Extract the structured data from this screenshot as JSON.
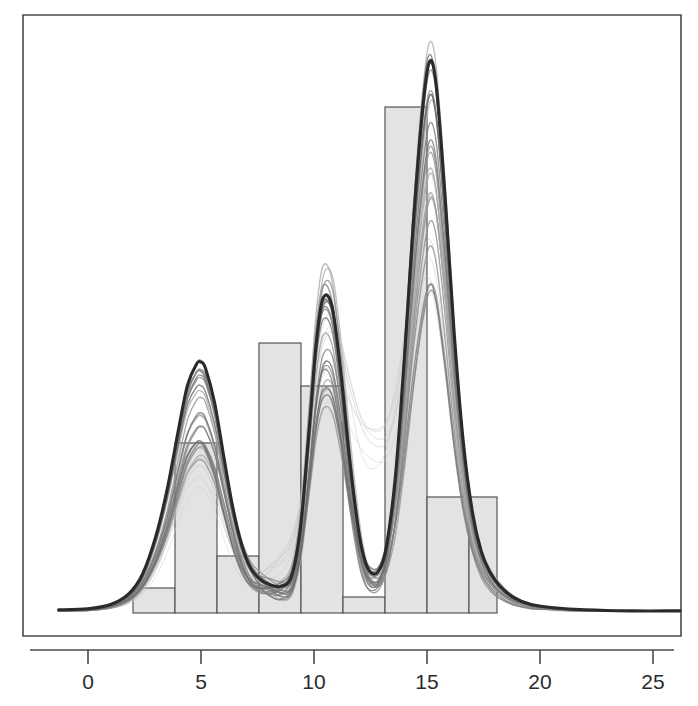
{
  "figure": {
    "name": "bootstrapped-kernel-density-over-histogram",
    "width": 698,
    "height": 706,
    "background_color": "#ffffff",
    "frame_color": "#4a4a4a"
  },
  "axis": {
    "x_tick_labels": [
      "0",
      "5",
      "10",
      "15",
      "20",
      "25"
    ],
    "x_tick_values": [
      0,
      5,
      10,
      15,
      20,
      25
    ],
    "x_tick_pixels": [
      88,
      201,
      314,
      427,
      540,
      653
    ],
    "label_color": "#2b2b2b",
    "label_font_size": 21
  },
  "colors": {
    "bar_fill": "#e3e3e3",
    "bar_stroke": "#555555",
    "main_curve": "#2a2a2a",
    "bootstrap_curve_dark": "#6d6d6d",
    "bootstrap_curve_light": "#cfcfcf"
  },
  "chart_data": {
    "type": "line",
    "title": "",
    "subtitle": "",
    "xlabel": "",
    "ylabel": "",
    "xlim": [
      -1.3,
      26.2
    ],
    "ylim": [
      0,
      0.268
    ],
    "grid": false,
    "legend": null,
    "annotations": [],
    "histogram": {
      "bin_edges": [
        2,
        3.86,
        5.72,
        7.58,
        9.44,
        11.3,
        13.16,
        15.02,
        16.88,
        18.14
      ],
      "bin_edges_pixels": [
        133,
        175,
        217,
        259,
        301,
        343,
        385,
        427,
        469,
        497
      ],
      "bin_counts_density": [
        0.018,
        0.101,
        0.036,
        0.138,
        0.118,
        0.0155,
        0.2,
        0.0755,
        0.0755
      ],
      "bin_top_pixels": [
        588,
        443,
        556,
        343,
        386,
        597,
        107,
        497,
        497
      ],
      "fill": "#e3e3e3",
      "stroke": "#555555",
      "baseline_pixel": 613
    },
    "main_density": {
      "name": "original sample kernel density estimate",
      "stroke": "#2a2a2a",
      "stroke_width": 3.1,
      "x": [
        -1.3,
        0.0,
        1.0,
        1.8,
        2.4,
        3.0,
        3.5,
        4.0,
        4.4,
        4.8,
        5.0,
        5.2,
        5.6,
        6.0,
        6.4,
        6.8,
        7.2,
        7.6,
        8.0,
        8.5,
        9.0,
        9.4,
        9.8,
        10.1,
        10.4,
        10.8,
        11.2,
        11.6,
        12.0,
        12.3,
        12.6,
        12.9,
        13.2,
        13.6,
        14.0,
        14.4,
        14.8,
        15.1,
        15.4,
        15.8,
        16.2,
        16.6,
        17.0,
        17.4,
        17.8,
        18.2,
        18.8,
        19.6,
        20.6,
        22.0,
        24.0,
        26.2
      ],
      "y": [
        0.0015,
        0.002,
        0.004,
        0.009,
        0.018,
        0.036,
        0.058,
        0.086,
        0.107,
        0.117,
        0.118,
        0.115,
        0.099,
        0.074,
        0.05,
        0.032,
        0.021,
        0.016,
        0.0135,
        0.0125,
        0.017,
        0.04,
        0.088,
        0.127,
        0.148,
        0.144,
        0.112,
        0.07,
        0.037,
        0.023,
        0.0185,
        0.0205,
        0.031,
        0.064,
        0.12,
        0.184,
        0.236,
        0.259,
        0.249,
        0.196,
        0.132,
        0.081,
        0.048,
        0.029,
        0.019,
        0.013,
        0.0075,
        0.004,
        0.0025,
        0.0015,
        0.001,
        0.001
      ]
    },
    "bootstrap_densities": {
      "name": "bootstrap replicate kernel density estimates",
      "count": 28,
      "description": "Overplotted light-to-dark gray resampled density curves tracking the same four modes with varying peak heights and a diffuse broad mode near x=12-15",
      "stroke_light": "#cfcfcf",
      "stroke_dark": "#6d6d6d",
      "mode_locations": [
        5.0,
        10.3,
        15.1
      ],
      "peak_height_range_mode1": [
        0.07,
        0.12
      ],
      "peak_height_range_mode2": [
        0.08,
        0.15
      ],
      "peak_height_range_mode3": [
        0.15,
        0.255
      ]
    }
  }
}
